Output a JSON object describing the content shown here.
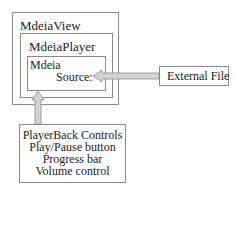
{
  "diagram": {
    "outer": {
      "label": "MdeiaView"
    },
    "player": {
      "label": "MdeiaPlayer"
    },
    "media": {
      "label": "Mdeia",
      "source_label": "Source:"
    },
    "external": {
      "label": "External File"
    },
    "controls": {
      "lines": [
        "PlayerBack Controls",
        "Play/Pause button",
        "Progress bar",
        "Volume control"
      ]
    },
    "arrows": [
      {
        "from": "External File",
        "to": "Source:"
      },
      {
        "from": "PlayerBack Controls",
        "to": "Mdeia"
      }
    ],
    "colors": {
      "border": "#8a8a8a",
      "arrow_fill": "#d4d4d4",
      "text": "#222222"
    }
  }
}
